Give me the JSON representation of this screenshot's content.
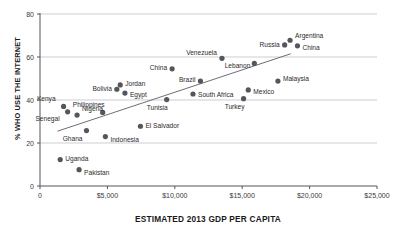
{
  "chart_data": {
    "type": "scatter",
    "title": "",
    "xlabel": "ESTIMATED 2013 GDP PER CAPITA",
    "ylabel": "% WHO USE THE INTERNET",
    "xlim": [
      0,
      25000
    ],
    "ylim": [
      0,
      80
    ],
    "grid": true,
    "legend": "none",
    "xticks": [
      "0",
      "$5,000",
      "$10,000",
      "$15,000",
      "$20,000",
      "$25,000"
    ],
    "xtick_values": [
      0,
      5000,
      10000,
      15000,
      20000,
      25000
    ],
    "yticks": [
      "0",
      "20",
      "40",
      "60",
      "80"
    ],
    "ytick_values": [
      0,
      20,
      40,
      60,
      80
    ],
    "point_color": "#55555c",
    "line_color": "#6e6e74",
    "grid_color": "#b9b9c0",
    "axis_color": "#55555c",
    "trendline": {
      "x_start": 1300,
      "y_start": 25.5,
      "x_end": 18600,
      "y_end": 61.5
    },
    "points": [
      {
        "name": "Kenya",
        "x": 1750,
        "y": 37.0,
        "label_dx": -8,
        "label_dy": -7,
        "anchor": "end"
      },
      {
        "name": "Senegal",
        "x": 2050,
        "y": 34.5,
        "label_dx": -8,
        "label_dy": 7,
        "anchor": "end"
      },
      {
        "name": "Uganda",
        "x": 1500,
        "y": 12.3,
        "label_dx": 5,
        "label_dy": -1,
        "anchor": "start"
      },
      {
        "name": "Nigeria",
        "x": 2750,
        "y": 33.0,
        "label_dx": 5,
        "label_dy": -6,
        "anchor": "start"
      },
      {
        "name": "Pakistan",
        "x": 2900,
        "y": 7.6,
        "label_dx": 5,
        "label_dy": 3,
        "anchor": "start"
      },
      {
        "name": "Ghana",
        "x": 3450,
        "y": 25.8,
        "label_dx": -4,
        "label_dy": 8,
        "anchor": "end"
      },
      {
        "name": "Philippines",
        "x": 4650,
        "y": 34.2,
        "label_dx": 2,
        "label_dy": -7,
        "anchor": "end"
      },
      {
        "name": "Bolivia",
        "x": 5700,
        "y": 45.0,
        "label_dx": -5,
        "label_dy": 0,
        "anchor": "end"
      },
      {
        "name": "Indonesia",
        "x": 4850,
        "y": 23.0,
        "label_dx": 5,
        "label_dy": 3,
        "anchor": "start"
      },
      {
        "name": "Jordan",
        "x": 5950,
        "y": 47.0,
        "label_dx": 5,
        "label_dy": -1,
        "anchor": "start"
      },
      {
        "name": "Egypt",
        "x": 6300,
        "y": 43.2,
        "label_dx": 5,
        "label_dy": 2,
        "anchor": "start"
      },
      {
        "name": "El Salvador",
        "x": 7450,
        "y": 27.8,
        "label_dx": 5,
        "label_dy": 0,
        "anchor": "start"
      },
      {
        "name": "China",
        "x": 9800,
        "y": 54.5,
        "label_dx": -5,
        "label_dy": -1,
        "anchor": "end"
      },
      {
        "name": "Tunisia",
        "x": 9400,
        "y": 40.2,
        "label_dx": 1,
        "label_dy": 8,
        "anchor": "end"
      },
      {
        "name": "South Africa",
        "x": 11350,
        "y": 42.8,
        "label_dx": 5,
        "label_dy": 1,
        "anchor": "start"
      },
      {
        "name": "Brazil",
        "x": 11900,
        "y": 48.8,
        "label_dx": -5,
        "label_dy": -1,
        "anchor": "end"
      },
      {
        "name": "Venezuela",
        "x": 13500,
        "y": 59.4,
        "label_dx": -5,
        "label_dy": -5,
        "anchor": "end"
      },
      {
        "name": "Turkey",
        "x": 15100,
        "y": 40.6,
        "label_dx": 1,
        "label_dy": 8,
        "anchor": "end"
      },
      {
        "name": "Mexico",
        "x": 15450,
        "y": 44.7,
        "label_dx": 5,
        "label_dy": 2,
        "anchor": "start"
      },
      {
        "name": "Lebanon",
        "x": 15900,
        "y": 57.0,
        "label_dx": -4,
        "label_dy": 3,
        "anchor": "end"
      },
      {
        "name": "Malaysia",
        "x": 17650,
        "y": 48.8,
        "label_dx": 5,
        "label_dy": -2,
        "anchor": "start"
      },
      {
        "name": "Russia",
        "x": 18150,
        "y": 65.6,
        "label_dx": -5,
        "label_dy": 0,
        "anchor": "end"
      },
      {
        "name": "Argentina",
        "x": 18550,
        "y": 67.8,
        "label_dx": 5,
        "label_dy": -4,
        "anchor": "start"
      },
      {
        "name": "China ",
        "x": 19100,
        "y": 65.2,
        "label_dx": 5,
        "label_dy": 2,
        "anchor": "start"
      }
    ]
  }
}
